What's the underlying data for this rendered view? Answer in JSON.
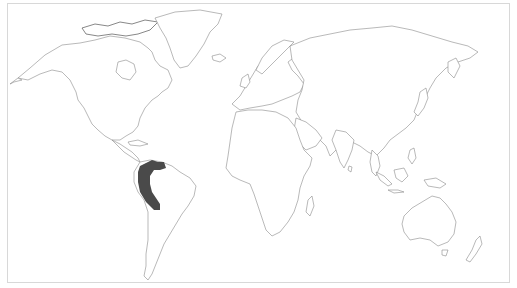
{
  "map": {
    "type": "world-outline-distribution-map",
    "projection": "equirectangular-like",
    "background": "#ffffff",
    "coastline_color": "#8a8a8a",
    "frame_color": "#d8d8d8",
    "highlighted_region": {
      "label": "range",
      "description": "Andes of northwestern South America (Venezuela, Colombia, Ecuador, Peru)",
      "fill": "#4a4a4a"
    }
  }
}
